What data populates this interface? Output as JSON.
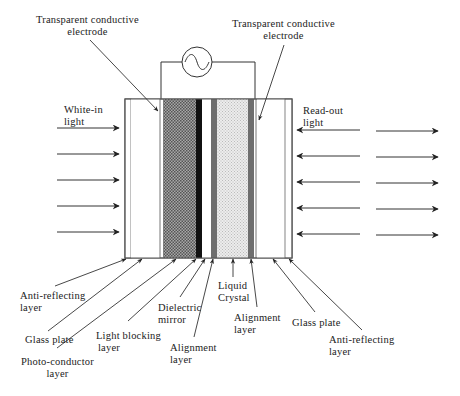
{
  "diagram": {
    "type": "liquid-crystal light valve cross-section",
    "top_labels": {
      "left_electrode": [
        "Transparent conductive",
        "electrode"
      ],
      "right_electrode": [
        "Transparent conductive",
        "electrode"
      ]
    },
    "side_labels": {
      "input": [
        "White-in",
        "light"
      ],
      "output": [
        "Read-out",
        "light"
      ]
    },
    "bottom_labels": {
      "anti_reflecting_left": [
        "Anti-reflecting",
        "layer"
      ],
      "glass_plate_left": [
        "Glass plate"
      ],
      "photo_conductor": [
        "Photo-conductor",
        "layer"
      ],
      "light_blocking": [
        "Light blocking",
        "layer"
      ],
      "dielectric_mirror": [
        "Dielectric",
        "mirror"
      ],
      "alignment_left": [
        "Alignment",
        "layer"
      ],
      "liquid_crystal": [
        "Liquid",
        "Crystal"
      ],
      "alignment_right": [
        "Alignment",
        "layer"
      ],
      "glass_plate_right": [
        "Glass plate"
      ],
      "anti_reflecting_right": [
        "Anti-reflecting",
        "layer"
      ]
    },
    "layers": [
      {
        "name": "Anti-reflecting layer",
        "x": 125,
        "w": 6,
        "fill": "#ffffff"
      },
      {
        "name": "Glass plate",
        "x": 131,
        "w": 29,
        "fill": "#ffffff"
      },
      {
        "name": "Transparent conductive electrode",
        "x": 160,
        "w": 3,
        "fill": "#ffffff"
      },
      {
        "name": "Photo-conductor layer",
        "x": 163,
        "w": 33,
        "fill": "#8a8a8a"
      },
      {
        "name": "Light blocking layer",
        "x": 196,
        "w": 6,
        "fill": "#111111"
      },
      {
        "name": "Dielectric mirror",
        "x": 202,
        "w": 9,
        "fill": "#ffffff"
      },
      {
        "name": "Alignment layer",
        "x": 211,
        "w": 6,
        "fill": "#6e6e6e"
      },
      {
        "name": "Liquid Crystal",
        "x": 217,
        "w": 31,
        "fill": "#dcdcdc"
      },
      {
        "name": "Alignment layer",
        "x": 248,
        "w": 6,
        "fill": "#6e6e6e"
      },
      {
        "name": "Transparent conductive electrode",
        "x": 254,
        "w": 3,
        "fill": "#ffffff"
      },
      {
        "name": "Glass plate",
        "x": 257,
        "w": 28,
        "fill": "#ffffff"
      },
      {
        "name": "Anti-reflecting layer",
        "x": 285,
        "w": 7,
        "fill": "#ffffff"
      }
    ],
    "ac_source_symbol": "sine-wave-source",
    "input_arrows": 5,
    "readout_arrows_in": 5,
    "readout_arrows_out": 5
  }
}
